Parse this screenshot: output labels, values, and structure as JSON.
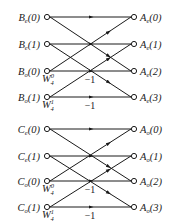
{
  "diagram": {
    "type": "fft-butterfly",
    "blocks": [
      {
        "inputs": [
          {
            "base": "B",
            "sub": "e",
            "idx": "(0)"
          },
          {
            "base": "B",
            "sub": "e",
            "idx": "(1)"
          },
          {
            "base": "B",
            "sub": "o",
            "idx": "(0)"
          },
          {
            "base": "B",
            "sub": "o",
            "idx": "(1)"
          }
        ],
        "outputs": [
          {
            "base": "A",
            "sub": "e",
            "idx": "(0)"
          },
          {
            "base": "A",
            "sub": "e",
            "idx": "(1)"
          },
          {
            "base": "A",
            "sub": "e",
            "idx": "(2)"
          },
          {
            "base": "A",
            "sub": "e",
            "idx": "(3)"
          }
        ],
        "twiddles": [
          {
            "base": "W",
            "sup": "0",
            "sub": "4"
          },
          {
            "base": "W",
            "sup": "1",
            "sub": "4"
          }
        ],
        "negations": [
          "−1",
          "−1"
        ]
      },
      {
        "inputs": [
          {
            "base": "C",
            "sub": "e",
            "idx": "(0)"
          },
          {
            "base": "C",
            "sub": "e",
            "idx": "(1)"
          },
          {
            "base": "C",
            "sub": "o",
            "idx": "(0)"
          },
          {
            "base": "C",
            "sub": "o",
            "idx": "(1)"
          }
        ],
        "outputs": [
          {
            "base": "A",
            "sub": "o",
            "idx": "(0)"
          },
          {
            "base": "A",
            "sub": "o",
            "idx": "(1)"
          },
          {
            "base": "A",
            "sub": "o",
            "idx": "(2)"
          },
          {
            "base": "A",
            "sub": "o",
            "idx": "(3)"
          }
        ],
        "twiddles": [
          {
            "base": "W",
            "sup": "0",
            "sub": "4"
          },
          {
            "base": "W",
            "sup": "1",
            "sub": "4"
          }
        ],
        "negations": [
          "−1",
          "−1"
        ]
      }
    ]
  }
}
